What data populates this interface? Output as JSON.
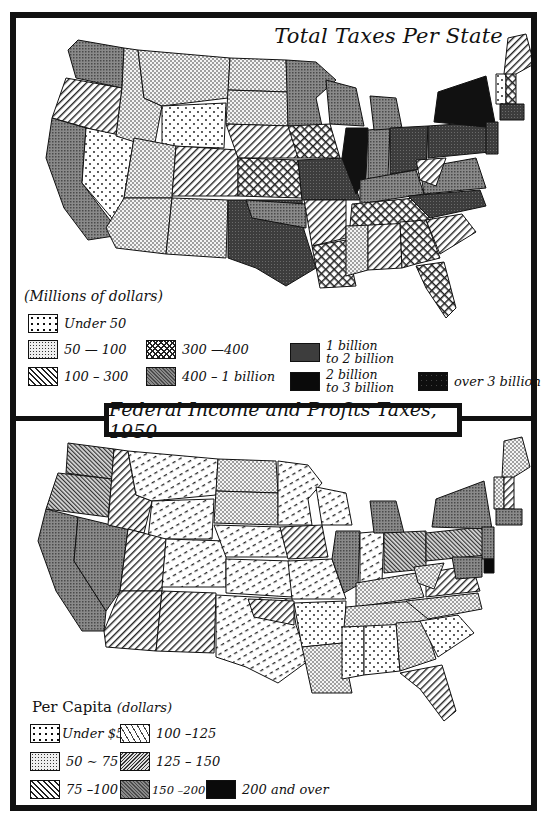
{
  "top_map": {
    "title": "Total Taxes Per State",
    "legend_heading": "(Millions of dollars)",
    "legend": [
      {
        "label": "Under 50",
        "pattern": "sparse-dots"
      },
      {
        "label": "50 — 100",
        "pattern": "dense-dots"
      },
      {
        "label": "100 – 300",
        "pattern": "diagonal-lines"
      },
      {
        "label": "300 —400",
        "pattern": "crosshatch"
      },
      {
        "label": "400 – 1 billion",
        "pattern": "fine-crosshatch-gray"
      },
      {
        "label_line1": "1 billion",
        "label_line2": "to 2 billion",
        "pattern": "dark-gray"
      },
      {
        "label_line1": "2 billion",
        "label_line2": "to 3 billion",
        "pattern": "black"
      },
      {
        "label": "over 3 billion",
        "pattern": "black-speckled"
      }
    ]
  },
  "bottom_map": {
    "title": "Federal Income and Profits Taxes, 1950",
    "legend_heading_main": "Per Capita",
    "legend_heading_unit": "(dollars)",
    "legend": [
      {
        "label": "Under $50",
        "pattern": "sparse-dots"
      },
      {
        "label": "50 ∼ 75",
        "pattern": "dense-dots"
      },
      {
        "label": "75 –100",
        "pattern": "diagonal-lines"
      },
      {
        "label": "100 –125",
        "pattern": "dashes"
      },
      {
        "label": "125 – 150",
        "pattern": "fine-diagonal"
      },
      {
        "label": "150 –200",
        "pattern": "fine-crosshatch-gray"
      },
      {
        "label": "200 and over",
        "pattern": "black"
      }
    ]
  },
  "colors": {
    "ink": "#111111",
    "paper": "#ffffff",
    "gray": "#6e6e6e",
    "dark": "#3a3a3a"
  }
}
